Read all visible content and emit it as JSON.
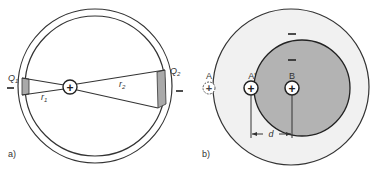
{
  "figure_a": {
    "panel_label": "a)",
    "charge_left_label": "Q",
    "charge_left_sub": "1",
    "charge_right_label": "Q",
    "charge_right_sub": "2",
    "radius_left_label": "r",
    "radius_left_sub": "1",
    "radius_right_label": "r",
    "radius_right_sub": "2",
    "center_charge_sign": "+",
    "left_sign": "–",
    "right_sign": "–"
  },
  "figure_b": {
    "panel_label": "b)",
    "point_a_label": "A",
    "point_a_prime_label": "A'",
    "point_b_label": "B",
    "point_a_sign": "+",
    "point_a_prime_sign": "+",
    "point_b_sign": "+",
    "outer_sign": "–",
    "inner_sign": "–",
    "distance_label": "d"
  },
  "colors": {
    "stroke": "#333333",
    "shell_fill": "#ffffff",
    "patch_fill": "#a9a9a9",
    "outer_region_fill": "#f1f1f1",
    "inner_region_fill": "#b3b3b3"
  }
}
